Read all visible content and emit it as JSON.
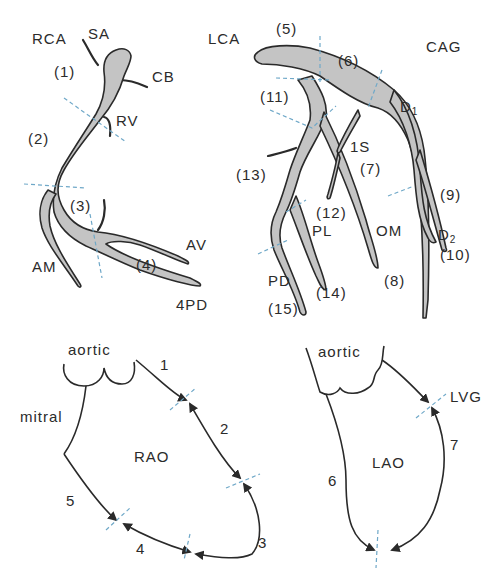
{
  "figure": {
    "title": "CAG",
    "rca": {
      "name": "RCA",
      "branches": [
        "SA",
        "CB",
        "RV",
        "AM",
        "AV",
        "4PD"
      ],
      "segments": [
        "(1)",
        "(2)",
        "(3)",
        "(4)"
      ]
    },
    "lca": {
      "name": "LCA",
      "branches": [
        "1S",
        "PL",
        "OM",
        "PD"
      ],
      "diagonals": {
        "d1": "D",
        "d1_sub": "1",
        "d2": "D",
        "d2_sub": "2"
      },
      "segments": [
        "(5)",
        "(6)",
        "(7)",
        "(8)",
        "(9)",
        "(10)",
        "(11)",
        "(12)",
        "(13)",
        "(14)",
        "(15)"
      ]
    },
    "rao": {
      "view": "RAO",
      "valves": {
        "aortic": "aortic",
        "mitral": "mitral"
      },
      "segments": [
        "1",
        "2",
        "3",
        "4",
        "5"
      ]
    },
    "lao": {
      "view": "LAO",
      "valves": {
        "aortic": "aortic"
      },
      "label_extra": "LVG",
      "segments": [
        "6",
        "7"
      ]
    },
    "colors": {
      "vessel_fill": "#c4c4c4",
      "outline": "#2a2a2a",
      "division_lines": "#6fa8c8"
    }
  }
}
